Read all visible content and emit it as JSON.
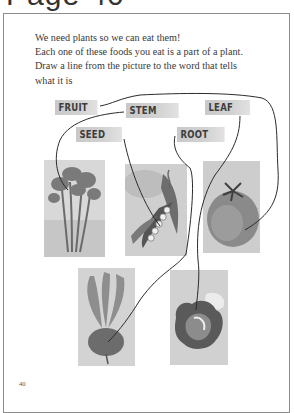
{
  "page": {
    "title": "Page 40",
    "page_number": "40"
  },
  "instructions": {
    "line1": "We need plants so we can eat them!",
    "line2": "Each one of these foods you eat is a part of a plant.",
    "line3": "Draw a line from the picture to the word that tells",
    "line4": "what it is"
  },
  "labels": {
    "fruit": "FRUIT",
    "stem": "STEM",
    "leaf": "LEAF",
    "seed": "SEED",
    "root": "ROOT"
  },
  "pictures": [
    {
      "name": "celery",
      "part": "STEM"
    },
    {
      "name": "pea-pod",
      "part": "SEED"
    },
    {
      "name": "tomato",
      "part": "FRUIT"
    },
    {
      "name": "beet",
      "part": "ROOT"
    },
    {
      "name": "lettuce",
      "part": "LEAF"
    }
  ],
  "colors": {
    "border": "#8c8c8c",
    "label_bg": "#cfcfcf",
    "ink": "#2b2b2b"
  }
}
